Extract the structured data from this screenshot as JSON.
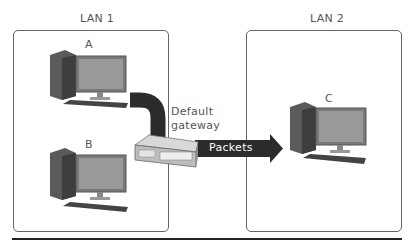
{
  "networks": [
    {
      "label": "LAN 1",
      "computers": [
        {
          "label": "A"
        },
        {
          "label": "B"
        }
      ]
    },
    {
      "label": "LAN 2",
      "computers": [
        {
          "label": "C"
        }
      ]
    }
  ],
  "gateway": {
    "label_line1": "Default",
    "label_line2": "gateway"
  },
  "arrow": {
    "label": "Packets"
  },
  "colors": {
    "path": "#2b2b2b",
    "box_border": "#666666",
    "text": "#555555"
  }
}
